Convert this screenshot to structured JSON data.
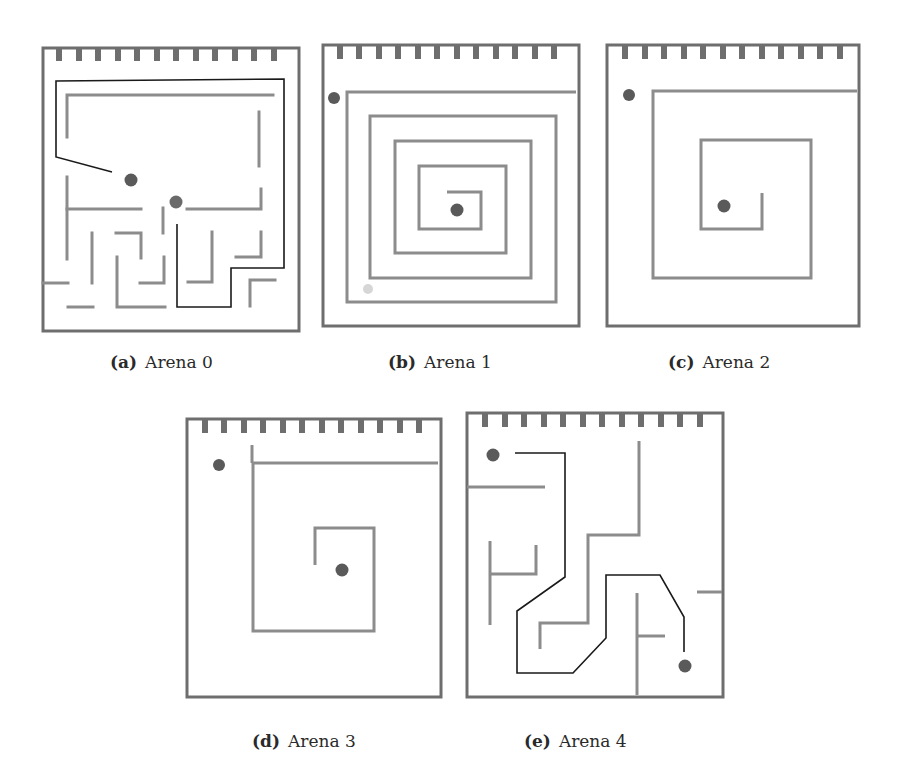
{
  "figure": {
    "colors": {
      "frame": "#6e6e6e",
      "wall": "#8c8c8c",
      "path": "#1a1a1a",
      "goal": "#5a5a5a",
      "faint_marker": "#d6d6d6",
      "background": "#ffffff"
    },
    "panels": [
      {
        "id": "a",
        "tag": "(a)",
        "label": "Arena 0"
      },
      {
        "id": "b",
        "tag": "(b)",
        "label": "Arena 1"
      },
      {
        "id": "c",
        "tag": "(c)",
        "label": "Arena 2"
      },
      {
        "id": "d",
        "tag": "(d)",
        "label": "Arena 3"
      },
      {
        "id": "e",
        "tag": "(e)",
        "label": "Arena 4"
      }
    ],
    "battlement_teeth_per_arena": 12
  }
}
